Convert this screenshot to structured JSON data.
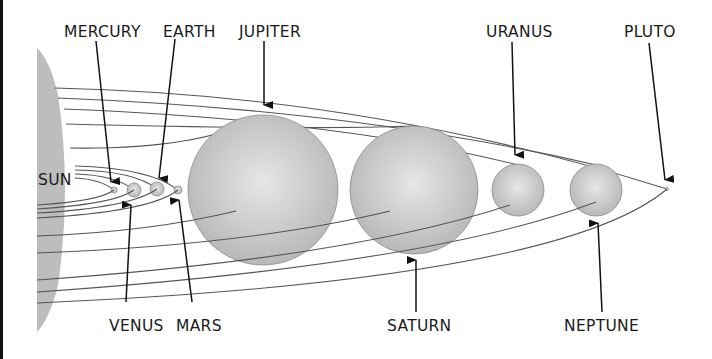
{
  "colors": {
    "sun": "#bcbcbc",
    "planet_light": "#e4e4e4",
    "planet_dark": "#b9b9b9",
    "orbit": "#555555",
    "label": "#1a1a1a",
    "arrow": "#111111"
  },
  "labels": {
    "sun": "SUN",
    "mercury": "MERCURY",
    "venus": "VENUS",
    "earth": "EARTH",
    "mars": "MARS",
    "jupiter": "JUPITER",
    "saturn": "SATURN",
    "uranus": "URANUS",
    "neptune": "NEPTUNE",
    "pluto": "PLUTO"
  },
  "bodies": [
    {
      "name": "Mercury",
      "cx": 114,
      "cy": 190,
      "r": 3
    },
    {
      "name": "Venus",
      "cx": 134,
      "cy": 190,
      "r": 7
    },
    {
      "name": "Earth",
      "cx": 157,
      "cy": 189,
      "r": 7
    },
    {
      "name": "Mars",
      "cx": 178,
      "cy": 190,
      "r": 4
    },
    {
      "name": "Jupiter",
      "cx": 263,
      "cy": 190,
      "r": 74
    },
    {
      "name": "Saturn",
      "cx": 414,
      "cy": 190,
      "r": 64
    },
    {
      "name": "Uranus",
      "cx": 518,
      "cy": 190,
      "r": 26
    },
    {
      "name": "Neptune",
      "cx": 596,
      "cy": 190,
      "r": 26
    },
    {
      "name": "Pluto",
      "cx": 667,
      "cy": 189,
      "r": 1.5
    }
  ]
}
